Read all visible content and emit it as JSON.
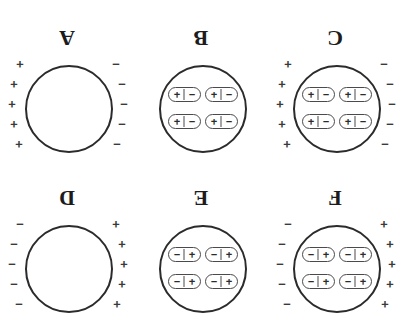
{
  "figure": {
    "orientation": "rotated-180",
    "background_color": "#ffffff",
    "stroke_color": "#2b2b2b",
    "rows": [
      {
        "name": "top-row",
        "panels": [
          {
            "label": "F",
            "has_dipoles": true,
            "has_surface_charges": true,
            "left_charge": "+",
            "right_charge": "−",
            "left_charge_count": 5,
            "right_charge_count": 5,
            "dipole_count": 4,
            "dipole_left_sign": "+",
            "dipole_right_sign": "−"
          },
          {
            "label": "E",
            "has_dipoles": true,
            "has_surface_charges": false,
            "left_charge": "",
            "right_charge": "",
            "left_charge_count": 0,
            "right_charge_count": 0,
            "dipole_count": 4,
            "dipole_left_sign": "+",
            "dipole_right_sign": "−"
          },
          {
            "label": "D",
            "has_dipoles": false,
            "has_surface_charges": true,
            "left_charge": "+",
            "right_charge": "−",
            "left_charge_count": 5,
            "right_charge_count": 5,
            "dipole_count": 0,
            "dipole_left_sign": "",
            "dipole_right_sign": ""
          }
        ]
      },
      {
        "name": "bottom-row",
        "panels": [
          {
            "label": "C",
            "has_dipoles": true,
            "has_surface_charges": true,
            "left_charge": "−",
            "right_charge": "+",
            "left_charge_count": 5,
            "right_charge_count": 5,
            "dipole_count": 4,
            "dipole_left_sign": "−",
            "dipole_right_sign": "+"
          },
          {
            "label": "B",
            "has_dipoles": true,
            "has_surface_charges": false,
            "left_charge": "",
            "right_charge": "",
            "left_charge_count": 0,
            "right_charge_count": 0,
            "dipole_count": 4,
            "dipole_left_sign": "−",
            "dipole_right_sign": "+"
          },
          {
            "label": "A",
            "has_dipoles": false,
            "has_surface_charges": true,
            "left_charge": "−",
            "right_charge": "+",
            "left_charge_count": 5,
            "right_charge_count": 5,
            "dipole_count": 0,
            "dipole_left_sign": "",
            "dipole_right_sign": ""
          }
        ]
      }
    ]
  }
}
